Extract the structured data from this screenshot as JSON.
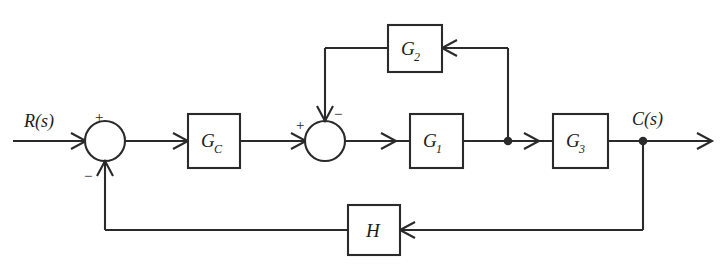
{
  "diagram": {
    "background_color": "#ffffff",
    "line_color": "#2a2a2a",
    "signals": {
      "input_label": "R(s)",
      "output_label": "C(s)"
    },
    "blocks": [
      {
        "id": "gc",
        "label": "G",
        "subscript": "C"
      },
      {
        "id": "g1",
        "label": "G",
        "subscript": "1"
      },
      {
        "id": "g2",
        "label": "G",
        "subscript": "2"
      },
      {
        "id": "g3",
        "label": "G",
        "subscript": "3"
      },
      {
        "id": "h",
        "label": "H",
        "subscript": ""
      }
    ],
    "summing_junctions": [
      {
        "id": "sum1",
        "signs": {
          "left_input": "+",
          "bottom_input": "−"
        }
      },
      {
        "id": "sum2",
        "signs": {
          "left_input": "+",
          "top_input": "−"
        }
      }
    ]
  }
}
